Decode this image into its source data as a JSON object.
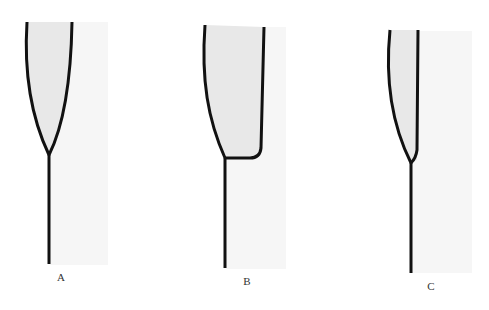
{
  "diagram": {
    "colors": {
      "fill": "#e9e9e9",
      "shade": "#f5f5f5",
      "stroke": "#111111",
      "label": "#333333"
    },
    "panels": [
      {
        "id": "A",
        "label": "A"
      },
      {
        "id": "B",
        "label": "B"
      },
      {
        "id": "C",
        "label": "C"
      }
    ]
  }
}
